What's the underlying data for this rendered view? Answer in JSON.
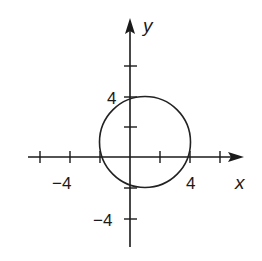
{
  "diagram": {
    "type": "coordinate-plane-circle",
    "axes": {
      "x_label": "x",
      "y_label": "y",
      "tick_spacing_units": 2,
      "x_tick_values": [
        -8,
        -6,
        -4,
        -2,
        2,
        4,
        6
      ],
      "y_tick_values": [
        -6,
        -4,
        -2,
        2,
        4,
        6
      ],
      "labeled_ticks": {
        "x_neg": "−4",
        "x_pos": "4",
        "y_pos": "4",
        "y_neg": "−4"
      }
    },
    "circle": {
      "center": [
        1,
        1
      ],
      "radius": 3
    }
  },
  "colors": {
    "ink": "#1a1a1a",
    "background": "#ffffff"
  }
}
